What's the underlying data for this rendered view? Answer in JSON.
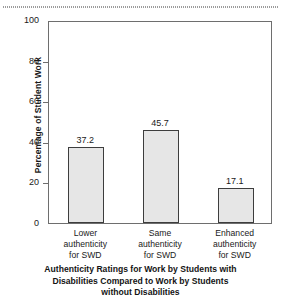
{
  "chart_data": {
    "type": "bar",
    "title": "",
    "caption_lines": [
      "Authenticity Ratings for Work by Students with",
      "Disabilities Compared to Work by Students",
      "without Disabilities"
    ],
    "xlabel": "Authenticity Ratings for Work by Students with Disabilities Compared to Work by Students without Disabilities",
    "ylabel": "Percentage of Student Work",
    "categories": [
      "Lower authenticity for SWD",
      "Same authenticity for SWD",
      "Enhanced authenticity for SWD"
    ],
    "category_lines": [
      [
        "Lower",
        "authenticity",
        "for SWD"
      ],
      [
        "Same",
        "authenticity",
        "for SWD"
      ],
      [
        "Enhanced",
        "authenticity",
        "for SWD"
      ]
    ],
    "values": [
      37.2,
      45.7,
      17.1
    ],
    "value_labels": [
      "37.2",
      "45.7",
      "17.1"
    ],
    "ylim": [
      0,
      100
    ],
    "yticks": [
      0,
      20,
      40,
      60,
      80,
      100
    ],
    "ytick_labels": [
      "0",
      "20",
      "40",
      "60",
      "80",
      "100"
    ],
    "grid": false,
    "legend": null,
    "bar_fill_color": "#e6e6e6",
    "bar_edge_color": "#3d3d3d",
    "axis_color": "#6e6e6e"
  }
}
